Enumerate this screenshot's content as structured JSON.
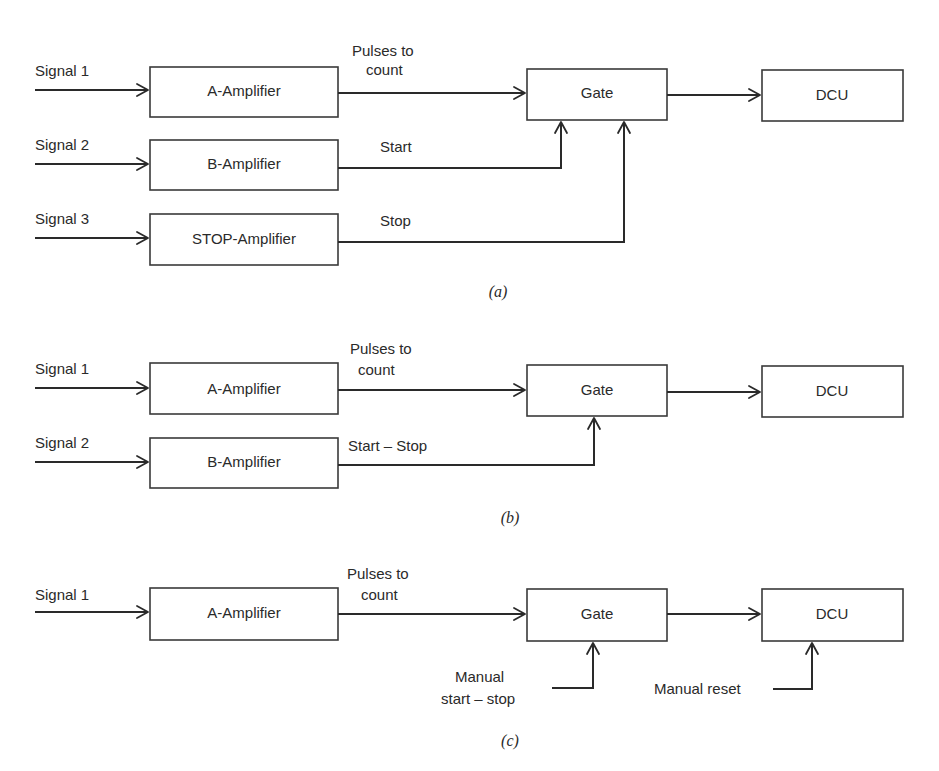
{
  "panels": [
    {
      "caption": "(a)",
      "inputs": [
        "Signal 1",
        "Signal 2",
        "Signal 3"
      ],
      "blocks": {
        "amp_a": "A-Amplifier",
        "amp_b": "B-Amplifier",
        "amp_stop": "STOP-Amplifier",
        "gate": "Gate",
        "dcu": "DCU"
      },
      "edge_labels": {
        "pulses_line1": "Pulses to",
        "pulses_line2": "count",
        "start": "Start",
        "stop": "Stop"
      }
    },
    {
      "caption": "(b)",
      "inputs": [
        "Signal 1",
        "Signal 2"
      ],
      "blocks": {
        "amp_a": "A-Amplifier",
        "amp_b": "B-Amplifier",
        "gate": "Gate",
        "dcu": "DCU"
      },
      "edge_labels": {
        "pulses_line1": "Pulses to",
        "pulses_line2": "count",
        "start_stop": "Start – Stop"
      }
    },
    {
      "caption": "(c)",
      "inputs": [
        "Signal 1"
      ],
      "blocks": {
        "amp_a": "A-Amplifier",
        "gate": "Gate",
        "dcu": "DCU"
      },
      "edge_labels": {
        "pulses_line1": "Pulses to",
        "pulses_line2": "count",
        "manual_line1": "Manual",
        "manual_line2": "start – stop",
        "manual_reset": "Manual reset"
      }
    }
  ]
}
